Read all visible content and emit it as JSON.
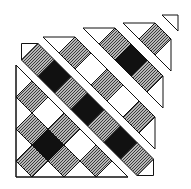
{
  "diagram": {
    "title": "Quilt block, exploded diagonal strips",
    "colors": {
      "background": "#ffffff",
      "outline": "#111111",
      "dark": "#111111",
      "light": "#ffffff",
      "print_base": "#b8b8b8",
      "print_dot": "#3a3a3a"
    },
    "strips": [
      {
        "name": "strip-1-corner-triangle",
        "outline": [
          [
            16,
            65
          ],
          [
            16,
            177
          ],
          [
            128,
            177
          ]
        ],
        "half_diagonal": 16,
        "squares": [
          {
            "c": [
              32,
              97
            ],
            "fill": "print"
          },
          {
            "c": [
              48,
              113
            ],
            "fill": "light"
          },
          {
            "c": [
              32,
              129
            ],
            "fill": "print"
          },
          {
            "c": [
              64,
              129
            ],
            "fill": "print"
          },
          {
            "c": [
              48,
              145
            ],
            "fill": "dark"
          },
          {
            "c": [
              80,
              145
            ],
            "fill": "light"
          },
          {
            "c": [
              32,
              161
            ],
            "fill": "print"
          },
          {
            "c": [
              64,
              161
            ],
            "fill": "print"
          },
          {
            "c": [
              96,
              161
            ],
            "fill": "print"
          }
        ],
        "triangles": [
          [
            [
              16,
              65
            ],
            [
              32,
              81
            ],
            [
              16,
              97
            ]
          ],
          [
            [
              16,
              97
            ],
            [
              32,
              113
            ],
            [
              16,
              129
            ]
          ],
          [
            [
              16,
              129
            ],
            [
              32,
              145
            ],
            [
              16,
              161
            ]
          ],
          [
            [
              16,
              161
            ],
            [
              32,
              177
            ],
            [
              16,
              177
            ]
          ],
          [
            [
              32,
              177
            ],
            [
              48,
              161
            ],
            [
              64,
              177
            ]
          ],
          [
            [
              64,
              177
            ],
            [
              80,
              161
            ],
            [
              96,
              177
            ]
          ],
          [
            [
              96,
              177
            ],
            [
              112,
              161
            ],
            [
              128,
              177
            ]
          ]
        ]
      },
      {
        "name": "strip-2",
        "half_diagonal": 16.5,
        "squares": [
          {
            "c": [
              38,
              60
            ],
            "fill": "print"
          },
          {
            "c": [
              54.5,
              76.5
            ],
            "fill": "dark"
          },
          {
            "c": [
              71,
              93
            ],
            "fill": "print"
          },
          {
            "c": [
              87.5,
              109.5
            ],
            "fill": "dark"
          },
          {
            "c": [
              104,
              126
            ],
            "fill": "print"
          },
          {
            "c": [
              120.5,
              142.5
            ],
            "fill": "dark"
          },
          {
            "c": [
              137,
              159
            ],
            "fill": "print"
          }
        ],
        "triangles": [
          [
            [
              21.5,
              43.5
            ],
            [
              38,
              43.5
            ],
            [
              21.5,
              60
            ]
          ],
          [
            [
              153.5,
              159
            ],
            [
              153.5,
              175.5
            ],
            [
              137,
              175.5
            ]
          ]
        ]
      },
      {
        "name": "strip-3",
        "half_diagonal": 16,
        "squares": [
          {
            "c": [
              75,
              53
            ],
            "fill": "print"
          },
          {
            "c": [
              91,
              69
            ],
            "fill": "light"
          },
          {
            "c": [
              107,
              85
            ],
            "fill": "print"
          },
          {
            "c": [
              123,
              101
            ],
            "fill": "light"
          },
          {
            "c": [
              139,
              117
            ],
            "fill": "print"
          }
        ],
        "triangles": [
          [
            [
              43,
              37
            ],
            [
              75,
              37
            ],
            [
              59,
              53
            ]
          ],
          [
            [
              155,
              117
            ],
            [
              155,
              149
            ],
            [
              139,
              133
            ]
          ]
        ]
      },
      {
        "name": "strip-4",
        "half_diagonal": 16,
        "squares": [
          {
            "c": [
              115,
              44
            ],
            "fill": "print"
          },
          {
            "c": [
              131,
              60
            ],
            "fill": "dark"
          },
          {
            "c": [
              147,
              76
            ],
            "fill": "print"
          }
        ],
        "triangles": [
          [
            [
              83,
              28
            ],
            [
              115,
              28
            ],
            [
              99,
              44
            ]
          ],
          [
            [
              163,
              76
            ],
            [
              163,
              108
            ],
            [
              147,
              92
            ]
          ]
        ]
      },
      {
        "name": "strip-5",
        "half_diagonal": 16,
        "squares": [
          {
            "c": [
              155,
              39
            ],
            "fill": "print"
          }
        ],
        "triangles": [
          [
            [
              123,
              23
            ],
            [
              155,
              23
            ],
            [
              139,
              39
            ]
          ],
          [
            [
              171,
              39
            ],
            [
              171,
              71
            ],
            [
              155,
              55
            ]
          ]
        ]
      },
      {
        "name": "strip-6-corner",
        "half_diagonal": 16,
        "squares": [],
        "triangles": [
          [
            [
              162,
              15
            ],
            [
              178,
              15
            ],
            [
              178,
              31
            ]
          ]
        ]
      }
    ]
  }
}
